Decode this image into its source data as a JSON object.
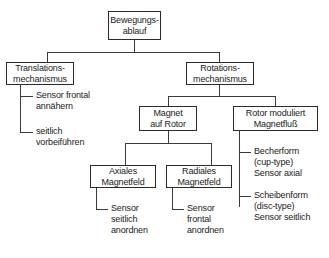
{
  "diagram": {
    "type": "tree",
    "nodes": {
      "root": {
        "id": "bewegungsablauf",
        "lines": [
          "Bewegungs-",
          "ablauf"
        ],
        "boxed": true
      },
      "translation": {
        "id": "translationsmechanismus",
        "lines": [
          "Translations-",
          "mechanismus"
        ],
        "boxed": true
      },
      "rotation": {
        "id": "rotationsmechanismus",
        "lines": [
          "Rotations-",
          "mechanismus"
        ],
        "boxed": true
      },
      "magnet_auf_rotor": {
        "id": "magnet-auf-rotor",
        "lines": [
          "Magnet",
          "auf Rotor"
        ],
        "boxed": true
      },
      "rotor_moduliert": {
        "id": "rotor-moduliert-magnetfluss",
        "lines": [
          "Rotor moduliert",
          "Magnetfluß"
        ],
        "boxed": true
      },
      "axiales": {
        "id": "axiales-magnetfeld",
        "lines": [
          "Axiales",
          "Magnetfeld"
        ],
        "boxed": true
      },
      "radiales": {
        "id": "radiales-magnetfeld",
        "lines": [
          "Radiales",
          "Magnetfeld"
        ],
        "boxed": true
      }
    },
    "leaves": {
      "sensor_frontal_annaehern": {
        "id": "sensor-frontal-annaehern",
        "lines": [
          "Sensor frontal",
          "annähern"
        ],
        "boxed": false
      },
      "seitlich_vorbeifuehren": {
        "id": "seitlich-vorbeifuehren",
        "lines": [
          "seitlich",
          "vorbeiführen"
        ],
        "boxed": false
      },
      "becherform": {
        "id": "becherform",
        "lines": [
          "Becherform",
          "(cup-type)",
          "Sensor axial"
        ],
        "boxed": false
      },
      "scheibenform": {
        "id": "scheibenform",
        "lines": [
          "Scheibenform",
          "(disc-type)",
          "Sensor seitlich"
        ],
        "boxed": false
      },
      "sensor_seitlich_anordnen": {
        "id": "sensor-seitlich-anordnen",
        "lines": [
          "Sensor",
          "seitlich",
          "anordnen"
        ],
        "boxed": false
      },
      "sensor_frontal_anordnen": {
        "id": "sensor-frontal-anordnen",
        "lines": [
          "Sensor",
          "frontal",
          "anordnen"
        ],
        "boxed": false
      }
    },
    "colors": {
      "background": "#ffffff",
      "box_border": "#2b2b2b",
      "connector": "#3a3a3a",
      "text": "#1a1a1a"
    }
  }
}
